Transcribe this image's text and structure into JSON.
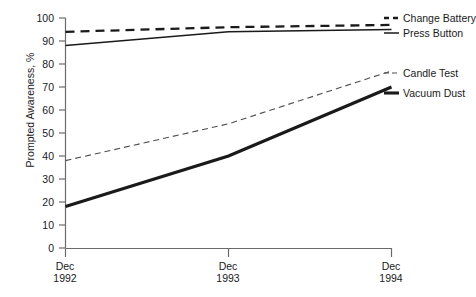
{
  "chart_data": {
    "type": "line",
    "title": "",
    "xlabel": "",
    "ylabel": "Prompted Awareness, %",
    "categories": [
      "Dec 1992",
      "Dec 1993",
      "Dec 1994"
    ],
    "x": [
      0,
      1,
      2
    ],
    "xlim": [
      0,
      2
    ],
    "ylim": [
      0,
      100
    ],
    "grid": false,
    "legend_position": "right",
    "y_ticks": [
      0,
      10,
      20,
      30,
      40,
      50,
      60,
      70,
      80,
      90,
      100
    ],
    "x_tick_labels": [
      {
        "month": "Dec",
        "year": "1992"
      },
      {
        "month": "Dec",
        "year": "1993"
      },
      {
        "month": "Dec",
        "year": "1994"
      }
    ],
    "series": [
      {
        "name": "Change Battery",
        "values": [
          94,
          96,
          97
        ],
        "style": "dashed",
        "width": "medium",
        "color": "#1a1a1a"
      },
      {
        "name": "Press Button",
        "values": [
          88,
          94,
          95
        ],
        "style": "solid",
        "width": "thin",
        "color": "#1a1a1a"
      },
      {
        "name": "Candle Test",
        "values": [
          38,
          54,
          77
        ],
        "style": "dashed",
        "width": "thin",
        "color": "#4d4d4d"
      },
      {
        "name": "Vacuum Dust",
        "values": [
          18,
          40,
          70
        ],
        "style": "solid",
        "width": "thick",
        "color": "#1a1a1a"
      }
    ]
  },
  "axis": {
    "y_title": "Prompted Awareness, %",
    "y_labels": [
      "100",
      "90",
      "80",
      "70",
      "60",
      "50",
      "40",
      "30",
      "20",
      "10",
      "0"
    ],
    "x_labels_month": [
      "Dec",
      "Dec",
      "Dec"
    ],
    "x_labels_year": [
      "1992",
      "1993",
      "1994"
    ]
  },
  "legend": {
    "items": [
      {
        "label": "Change Battery"
      },
      {
        "label": "Press Button"
      },
      {
        "label": "Candle Test"
      },
      {
        "label": "Vacuum Dust"
      }
    ]
  },
  "colors": {
    "axis": "#6b6b6b",
    "text": "#1a1a1a",
    "series_dark": "#1a1a1a",
    "series_gray": "#4d4d4d",
    "background": "#ffffff"
  }
}
